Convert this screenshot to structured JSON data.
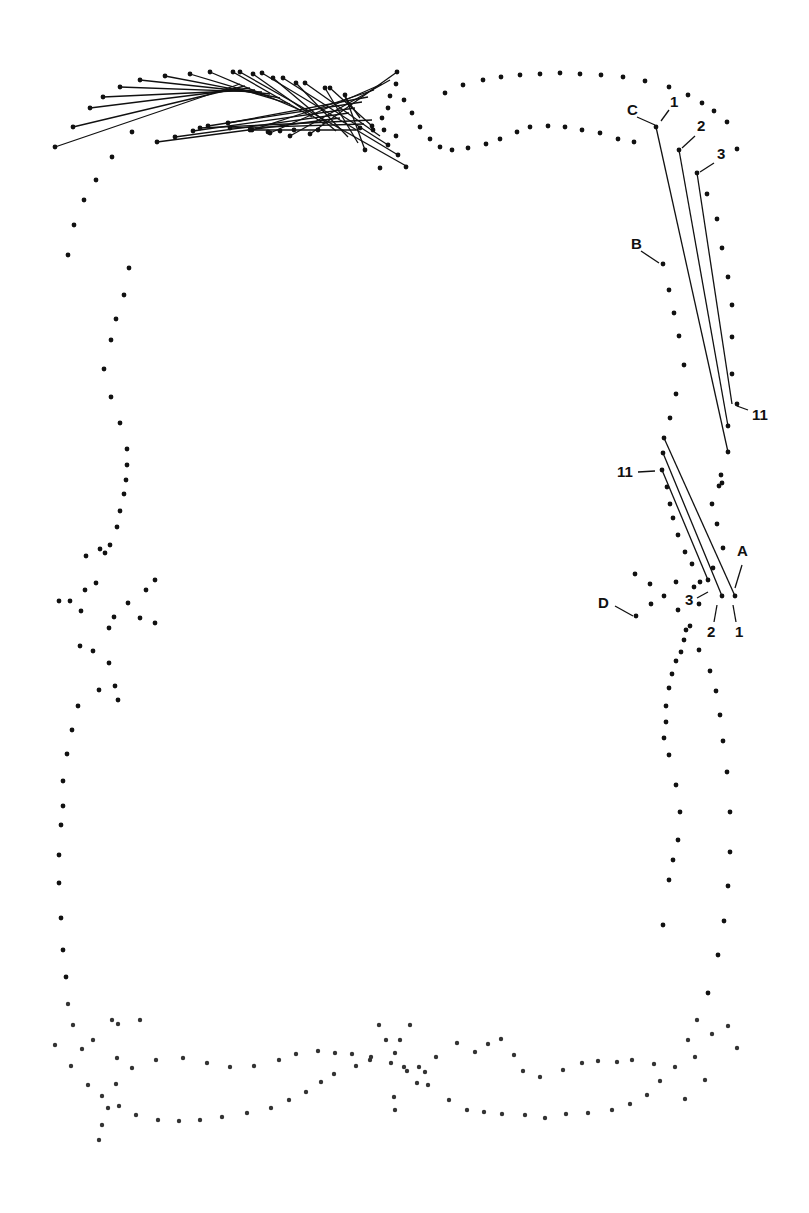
{
  "diagram": {
    "title": "",
    "background": "#ffffff",
    "ink": "#111111",
    "labels": [
      {
        "text": "C",
        "x": 627,
        "y": 115,
        "lx1": 637,
        "ly1": 117,
        "lx2": 655,
        "ly2": 125
      },
      {
        "text": "1",
        "x": 670,
        "y": 107,
        "lx1": 669,
        "ly1": 110,
        "lx2": 661,
        "ly2": 121
      },
      {
        "text": "2",
        "x": 697,
        "y": 131,
        "lx1": 695,
        "ly1": 136,
        "lx2": 682,
        "ly2": 148
      },
      {
        "text": "3",
        "x": 717,
        "y": 159,
        "lx1": 714,
        "ly1": 163,
        "lx2": 700,
        "ly2": 172
      },
      {
        "text": "B",
        "x": 631,
        "y": 249,
        "lx1": 641,
        "ly1": 251,
        "lx2": 659,
        "ly2": 263
      },
      {
        "text": "11",
        "x": 752,
        "y": 420,
        "lx1": 737,
        "ly1": 406,
        "lx2": 748,
        "ly2": 410
      },
      {
        "text": "11",
        "x": 617,
        "y": 477,
        "lx1": 638,
        "ly1": 472,
        "lx2": 655,
        "ly2": 471
      },
      {
        "text": "A",
        "x": 737,
        "y": 556,
        "lx1": 742,
        "ly1": 565,
        "lx2": 735,
        "ly2": 588
      },
      {
        "text": "3",
        "x": 685,
        "y": 605,
        "lx1": 697,
        "ly1": 598,
        "lx2": 708,
        "ly2": 592
      },
      {
        "text": "D",
        "x": 598,
        "y": 608,
        "lx1": 615,
        "ly1": 606,
        "lx2": 633,
        "ly2": 616
      },
      {
        "text": "2",
        "x": 707,
        "y": 637,
        "lx1": 714,
        "ly1": 622,
        "lx2": 717,
        "ly2": 605
      },
      {
        "text": "1",
        "x": 735,
        "y": 637,
        "lx1": 736,
        "ly1": 622,
        "lx2": 733,
        "ly2": 605
      }
    ],
    "stitch_lines": [
      [
        55,
        147,
        240,
        84
      ],
      [
        73,
        127,
        245,
        86
      ],
      [
        90,
        108,
        250,
        88
      ],
      [
        103,
        97,
        255,
        90
      ],
      [
        120,
        87,
        262,
        92
      ],
      [
        140,
        80,
        270,
        94
      ],
      [
        165,
        76,
        280,
        98
      ],
      [
        190,
        74,
        290,
        104
      ],
      [
        210,
        72,
        300,
        110
      ],
      [
        233,
        72,
        312,
        117
      ],
      [
        253,
        74,
        324,
        124
      ],
      [
        273,
        78,
        336,
        131
      ],
      [
        296,
        83,
        348,
        137
      ],
      [
        325,
        88,
        358,
        143
      ],
      [
        345,
        95,
        365,
        150
      ],
      [
        240,
        72,
        408,
        167
      ],
      [
        262,
        73,
        398,
        155
      ],
      [
        283,
        78,
        388,
        145
      ],
      [
        305,
        83,
        380,
        136
      ],
      [
        330,
        88,
        372,
        126
      ],
      [
        345,
        97,
        360,
        118
      ],
      [
        157,
        142,
        340,
        118
      ],
      [
        175,
        137,
        349,
        113
      ],
      [
        193,
        131,
        355,
        108
      ],
      [
        208,
        126,
        362,
        102
      ],
      [
        228,
        123,
        368,
        97
      ],
      [
        252,
        130,
        374,
        90
      ],
      [
        270,
        133,
        382,
        84
      ],
      [
        290,
        136,
        390,
        80
      ],
      [
        310,
        134,
        397,
        72
      ],
      [
        200,
        128,
        372,
        120
      ],
      [
        230,
        128,
        364,
        124
      ],
      [
        250,
        130,
        356,
        130
      ],
      [
        656,
        127,
        728,
        452
      ],
      [
        679,
        150,
        728,
        426
      ],
      [
        697,
        173,
        732,
        404
      ],
      [
        664,
        438,
        735,
        596
      ],
      [
        663,
        453,
        722,
        596
      ],
      [
        662,
        470,
        708,
        580
      ]
    ],
    "dots": [
      [
        55,
        147
      ],
      [
        73,
        127
      ],
      [
        90,
        108
      ],
      [
        103,
        97
      ],
      [
        120,
        87
      ],
      [
        140,
        80
      ],
      [
        165,
        76
      ],
      [
        190,
        74
      ],
      [
        210,
        72
      ],
      [
        233,
        72
      ],
      [
        253,
        74
      ],
      [
        273,
        78
      ],
      [
        296,
        83
      ],
      [
        325,
        88
      ],
      [
        345,
        95
      ],
      [
        240,
        72
      ],
      [
        262,
        73
      ],
      [
        283,
        78
      ],
      [
        305,
        83
      ],
      [
        330,
        88
      ],
      [
        157,
        142
      ],
      [
        175,
        137
      ],
      [
        193,
        131
      ],
      [
        208,
        126
      ],
      [
        228,
        123
      ],
      [
        252,
        130
      ],
      [
        270,
        133
      ],
      [
        290,
        136
      ],
      [
        310,
        134
      ],
      [
        200,
        128
      ],
      [
        230,
        128
      ],
      [
        250,
        130
      ],
      [
        268,
        132
      ],
      [
        280,
        131
      ],
      [
        294,
        130
      ],
      [
        318,
        130
      ],
      [
        397,
        72
      ],
      [
        396,
        84
      ],
      [
        390,
        96
      ],
      [
        388,
        108
      ],
      [
        382,
        118
      ],
      [
        372,
        126
      ],
      [
        360,
        128
      ],
      [
        384,
        130
      ],
      [
        396,
        136
      ],
      [
        388,
        145
      ],
      [
        398,
        155
      ],
      [
        406,
        167
      ],
      [
        380,
        168
      ],
      [
        365,
        150
      ],
      [
        373,
        130
      ],
      [
        132,
        132
      ],
      [
        112,
        157
      ],
      [
        96,
        180
      ],
      [
        84,
        200
      ],
      [
        74,
        225
      ],
      [
        68,
        255
      ],
      [
        404,
        100
      ],
      [
        412,
        113
      ],
      [
        420,
        127
      ],
      [
        430,
        139
      ],
      [
        440,
        147
      ],
      [
        452,
        150
      ],
      [
        468,
        148
      ],
      [
        486,
        144
      ],
      [
        500,
        139
      ],
      [
        517,
        132
      ],
      [
        530,
        127
      ],
      [
        548,
        126
      ],
      [
        565,
        127
      ],
      [
        582,
        130
      ],
      [
        600,
        133
      ],
      [
        618,
        139
      ],
      [
        634,
        142
      ],
      [
        445,
        93
      ],
      [
        463,
        85
      ],
      [
        483,
        80
      ],
      [
        501,
        77
      ],
      [
        520,
        75
      ],
      [
        540,
        74
      ],
      [
        560,
        73
      ],
      [
        580,
        74
      ],
      [
        601,
        75
      ],
      [
        623,
        77
      ],
      [
        645,
        81
      ],
      [
        669,
        87
      ],
      [
        688,
        95
      ],
      [
        702,
        103
      ],
      [
        714,
        111
      ],
      [
        727,
        122
      ],
      [
        737,
        149
      ],
      [
        656,
        127
      ],
      [
        679,
        150
      ],
      [
        697,
        173
      ],
      [
        707,
        194
      ],
      [
        717,
        219
      ],
      [
        722,
        248
      ],
      [
        728,
        277
      ],
      [
        732,
        305
      ],
      [
        732,
        337
      ],
      [
        732,
        374
      ],
      [
        737,
        404
      ],
      [
        728,
        426
      ],
      [
        728,
        452
      ],
      [
        719,
        486
      ],
      [
        663,
        264
      ],
      [
        669,
        290
      ],
      [
        674,
        313
      ],
      [
        679,
        336
      ],
      [
        684,
        365
      ],
      [
        676,
        394
      ],
      [
        670,
        418
      ],
      [
        664,
        438
      ],
      [
        663,
        453
      ],
      [
        662,
        470
      ],
      [
        667,
        487
      ],
      [
        670,
        504
      ],
      [
        673,
        518
      ],
      [
        678,
        535
      ],
      [
        685,
        552
      ],
      [
        692,
        564
      ],
      [
        700,
        582
      ],
      [
        708,
        580
      ],
      [
        722,
        596
      ],
      [
        735,
        596
      ],
      [
        723,
        548
      ],
      [
        717,
        524
      ],
      [
        712,
        504
      ],
      [
        721,
        475
      ],
      [
        722,
        483
      ],
      [
        635,
        574
      ],
      [
        650,
        584
      ],
      [
        664,
        596
      ],
      [
        676,
        582
      ],
      [
        636,
        616
      ],
      [
        651,
        604
      ],
      [
        678,
        610
      ],
      [
        699,
        604
      ],
      [
        694,
        587
      ],
      [
        713,
        568
      ],
      [
        690,
        626
      ],
      [
        686,
        630
      ],
      [
        684,
        640
      ],
      [
        681,
        652
      ],
      [
        676,
        661
      ],
      [
        672,
        674
      ],
      [
        669,
        688
      ],
      [
        666,
        706
      ],
      [
        666,
        722
      ],
      [
        664,
        738
      ],
      [
        669,
        755
      ],
      [
        676,
        785
      ],
      [
        680,
        812
      ],
      [
        678,
        840
      ],
      [
        673,
        860
      ],
      [
        669,
        880
      ],
      [
        663,
        925
      ],
      [
        699,
        650
      ],
      [
        710,
        671
      ],
      [
        716,
        691
      ],
      [
        720,
        715
      ],
      [
        723,
        741
      ],
      [
        727,
        772
      ],
      [
        730,
        812
      ],
      [
        730,
        852
      ],
      [
        728,
        886
      ],
      [
        724,
        921
      ],
      [
        718,
        955
      ],
      [
        708,
        993
      ],
      [
        697,
        1020
      ],
      [
        688,
        1040
      ],
      [
        112,
        1020
      ],
      [
        140,
        1020
      ],
      [
        118,
        1024
      ],
      [
        117,
        1058
      ],
      [
        116,
        1084
      ],
      [
        108,
        1108
      ],
      [
        102,
        1125
      ],
      [
        99,
        1140
      ],
      [
        129,
        268
      ],
      [
        124,
        295
      ],
      [
        116,
        319
      ],
      [
        111,
        340
      ],
      [
        104,
        369
      ],
      [
        111,
        397
      ],
      [
        120,
        423
      ],
      [
        127,
        449
      ],
      [
        127,
        465
      ],
      [
        126,
        480
      ],
      [
        124,
        494
      ],
      [
        120,
        511
      ],
      [
        117,
        527
      ],
      [
        110,
        545
      ],
      [
        105,
        553
      ],
      [
        100,
        549
      ],
      [
        86,
        556
      ],
      [
        96,
        583
      ],
      [
        85,
        590
      ],
      [
        70,
        601
      ],
      [
        59,
        601
      ],
      [
        81,
        611
      ],
      [
        114,
        617
      ],
      [
        140,
        618
      ],
      [
        146,
        590
      ],
      [
        128,
        603
      ],
      [
        155,
        580
      ],
      [
        155,
        623
      ],
      [
        109,
        628
      ],
      [
        93,
        651
      ],
      [
        80,
        646
      ],
      [
        109,
        663
      ],
      [
        99,
        690
      ],
      [
        115,
        686
      ],
      [
        118,
        700
      ],
      [
        78,
        706
      ],
      [
        72,
        730
      ],
      [
        67,
        754
      ],
      [
        63,
        781
      ],
      [
        63,
        806
      ],
      [
        61,
        825
      ],
      [
        59,
        855
      ],
      [
        59,
        883
      ],
      [
        61,
        918
      ],
      [
        63,
        950
      ],
      [
        66,
        977
      ],
      [
        68,
        1004
      ],
      [
        73,
        1025
      ],
      [
        82,
        1049
      ],
      [
        55,
        1045
      ],
      [
        71,
        1066
      ],
      [
        88,
        1085
      ],
      [
        102,
        1096
      ],
      [
        119,
        1106
      ],
      [
        136,
        1115
      ],
      [
        158,
        1120
      ],
      [
        179,
        1121
      ],
      [
        200,
        1120
      ],
      [
        222,
        1117
      ],
      [
        247,
        1113
      ],
      [
        271,
        1108
      ],
      [
        289,
        1100
      ],
      [
        306,
        1092
      ],
      [
        321,
        1082
      ],
      [
        334,
        1074
      ],
      [
        356,
        1066
      ],
      [
        370,
        1060
      ],
      [
        93,
        1040
      ],
      [
        132,
        1068
      ],
      [
        156,
        1060
      ],
      [
        183,
        1058
      ],
      [
        207,
        1063
      ],
      [
        230,
        1067
      ],
      [
        254,
        1066
      ],
      [
        279,
        1060
      ],
      [
        296,
        1054
      ],
      [
        318,
        1051
      ],
      [
        335,
        1053
      ],
      [
        352,
        1054
      ],
      [
        371,
        1057
      ],
      [
        391,
        1063
      ],
      [
        407,
        1071
      ],
      [
        379,
        1025
      ],
      [
        410,
        1025
      ],
      [
        386,
        1040
      ],
      [
        400,
        1040
      ],
      [
        395,
        1053
      ],
      [
        404,
        1067
      ],
      [
        419,
        1067
      ],
      [
        417,
        1083
      ],
      [
        394,
        1097
      ],
      [
        395,
        1110
      ],
      [
        425,
        1072
      ],
      [
        436,
        1057
      ],
      [
        457,
        1043
      ],
      [
        475,
        1052
      ],
      [
        488,
        1044
      ],
      [
        501,
        1039
      ],
      [
        514,
        1055
      ],
      [
        523,
        1071
      ],
      [
        540,
        1077
      ],
      [
        563,
        1070
      ],
      [
        582,
        1063
      ],
      [
        598,
        1061
      ],
      [
        617,
        1062
      ],
      [
        632,
        1060
      ],
      [
        654,
        1064
      ],
      [
        428,
        1085
      ],
      [
        449,
        1100
      ],
      [
        467,
        1110
      ],
      [
        484,
        1112
      ],
      [
        502,
        1114
      ],
      [
        525,
        1115
      ],
      [
        545,
        1118
      ],
      [
        566,
        1114
      ],
      [
        588,
        1113
      ],
      [
        612,
        1110
      ],
      [
        630,
        1104
      ],
      [
        647,
        1095
      ],
      [
        660,
        1081
      ],
      [
        675,
        1067
      ],
      [
        695,
        1057
      ],
      [
        712,
        1034
      ],
      [
        728,
        1026
      ],
      [
        737,
        1048
      ],
      [
        705,
        1080
      ],
      [
        685,
        1099
      ]
    ]
  }
}
